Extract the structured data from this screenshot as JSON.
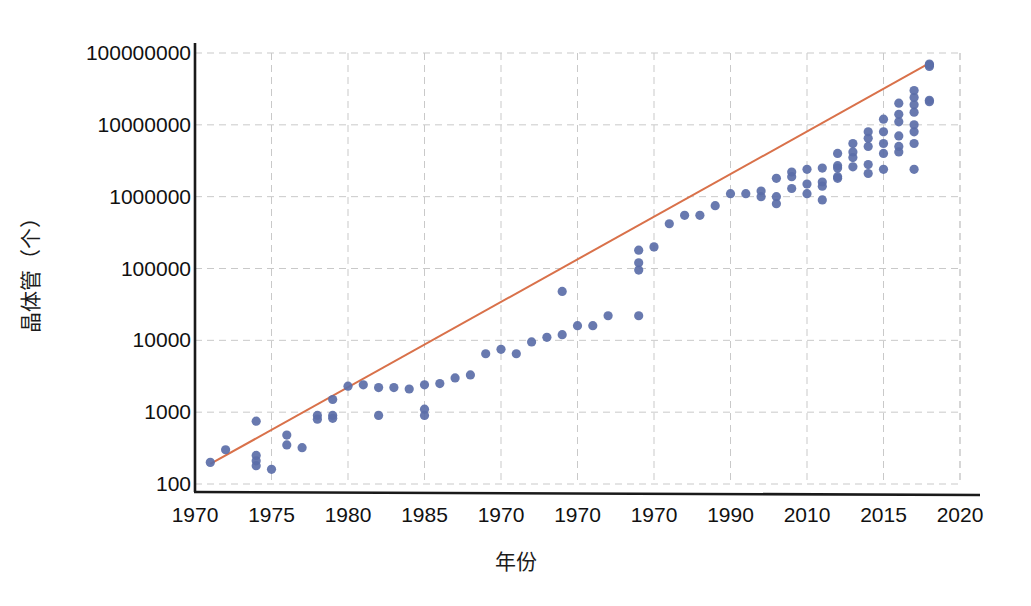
{
  "chart_data": {
    "type": "scatter",
    "title": "",
    "xlabel": "年份",
    "ylabel": "晶体管（个）",
    "yscale": "log",
    "ylim": [
      100,
      100000000
    ],
    "xlim": [
      1970,
      2020
    ],
    "grid": true,
    "legend": null,
    "ytick_labels": [
      "100000000",
      "10000000",
      "1000000",
      "100000",
      "10000",
      "1000",
      "100"
    ],
    "ytick_values": [
      100000000,
      10000000,
      1000000,
      100000,
      10000,
      1000,
      100
    ],
    "xtick_labels": [
      "1970",
      "1975",
      "1980",
      "1985",
      "1970",
      "1970",
      "1970",
      "1990",
      "2010",
      "2015",
      "2020"
    ],
    "xtick_values": [
      1970,
      1975,
      1980,
      1985,
      1990,
      1995,
      2000,
      2005,
      2010,
      2015,
      2020
    ],
    "colors": {
      "points": "#5b6ea8",
      "trendline": "#d9714a",
      "grid": "#c9c9c9",
      "axis": "#1a1a1a",
      "background": "#ffffff"
    },
    "series": [
      {
        "name": "晶体管数量",
        "type": "scatter",
        "marker": "circle",
        "color": "#5b6ea8",
        "points": [
          [
            1971,
            200
          ],
          [
            1972,
            300
          ],
          [
            1974,
            750
          ],
          [
            1974,
            250
          ],
          [
            1974,
            210
          ],
          [
            1974,
            180
          ],
          [
            1975,
            160
          ],
          [
            1976,
            480
          ],
          [
            1976,
            350
          ],
          [
            1977,
            320
          ],
          [
            1978,
            900
          ],
          [
            1978,
            800
          ],
          [
            1979,
            900
          ],
          [
            1979,
            820
          ],
          [
            1979,
            1500
          ],
          [
            1980,
            2300
          ],
          [
            1981,
            2400
          ],
          [
            1982,
            2200
          ],
          [
            1982,
            900
          ],
          [
            1983,
            2200
          ],
          [
            1984,
            2100
          ],
          [
            1985,
            2400
          ],
          [
            1985,
            1100
          ],
          [
            1985,
            900
          ],
          [
            1986,
            2500
          ],
          [
            1987,
            3000
          ],
          [
            1988,
            3300
          ],
          [
            1989,
            6500
          ],
          [
            1990,
            7500
          ],
          [
            1991,
            6500
          ],
          [
            1992,
            9500
          ],
          [
            1993,
            11000
          ],
          [
            1994,
            12000
          ],
          [
            1994,
            48000
          ],
          [
            1995,
            16000
          ],
          [
            1996,
            16000
          ],
          [
            1997,
            22000
          ],
          [
            1999,
            120000
          ],
          [
            1999,
            180000
          ],
          [
            1999,
            95000
          ],
          [
            1999,
            22000
          ],
          [
            2000,
            200000
          ],
          [
            2001,
            420000
          ],
          [
            2002,
            550000
          ],
          [
            2003,
            550000
          ],
          [
            2004,
            750000
          ],
          [
            2005,
            1100000
          ],
          [
            2006,
            1100000
          ],
          [
            2007,
            1000000
          ],
          [
            2007,
            1200000
          ],
          [
            2008,
            1800000
          ],
          [
            2008,
            1000000
          ],
          [
            2008,
            800000
          ],
          [
            2009,
            2200000
          ],
          [
            2009,
            1900000
          ],
          [
            2009,
            1300000
          ],
          [
            2010,
            2400000
          ],
          [
            2010,
            1500000
          ],
          [
            2010,
            1100000
          ],
          [
            2011,
            2500000
          ],
          [
            2011,
            1600000
          ],
          [
            2011,
            1400000
          ],
          [
            2011,
            900000
          ],
          [
            2012,
            4000000
          ],
          [
            2012,
            2700000
          ],
          [
            2012,
            2500000
          ],
          [
            2012,
            1900000
          ],
          [
            2012,
            1800000
          ],
          [
            2013,
            5500000
          ],
          [
            2013,
            4200000
          ],
          [
            2013,
            3500000
          ],
          [
            2013,
            2600000
          ],
          [
            2014,
            8000000
          ],
          [
            2014,
            6500000
          ],
          [
            2014,
            5000000
          ],
          [
            2014,
            2800000
          ],
          [
            2014,
            2100000
          ],
          [
            2015,
            12000000
          ],
          [
            2015,
            8000000
          ],
          [
            2015,
            5500000
          ],
          [
            2015,
            4000000
          ],
          [
            2015,
            2400000
          ],
          [
            2016,
            20000000
          ],
          [
            2016,
            14000000
          ],
          [
            2016,
            11000000
          ],
          [
            2016,
            7000000
          ],
          [
            2016,
            5000000
          ],
          [
            2016,
            4200000
          ],
          [
            2017,
            30000000
          ],
          [
            2017,
            24000000
          ],
          [
            2017,
            19000000
          ],
          [
            2017,
            15000000
          ],
          [
            2017,
            10000000
          ],
          [
            2017,
            8000000
          ],
          [
            2017,
            5500000
          ],
          [
            2017,
            2400000
          ],
          [
            2018,
            22000000
          ],
          [
            2018,
            21000000
          ],
          [
            2018,
            70000000
          ],
          [
            2018,
            68000000
          ],
          [
            2018,
            65000000
          ]
        ]
      },
      {
        "name": "趋势线",
        "type": "line",
        "color": "#d9714a",
        "points": [
          [
            1971,
            190
          ],
          [
            2018,
            72000000
          ]
        ]
      }
    ]
  }
}
